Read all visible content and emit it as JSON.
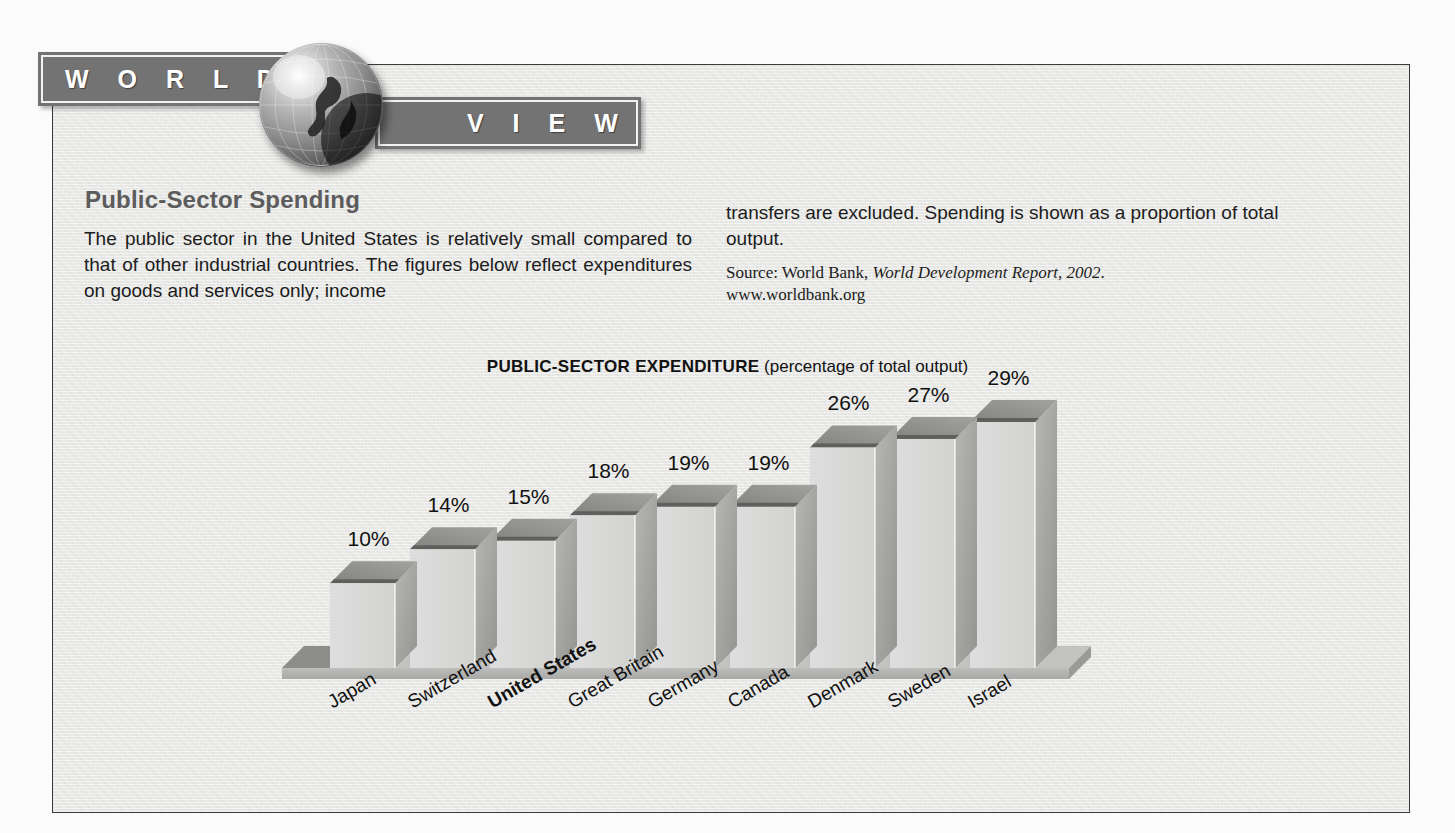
{
  "banner": {
    "word_left": "W O R L D",
    "word_right": "V I E W",
    "globe_icon": "globe-icon"
  },
  "article": {
    "headline": "Public-Sector Spending",
    "body_left": "The public sector in the United States is relatively small compared to that of other industrial countries. The figures below reflect expenditures on goods and services only; income",
    "body_right": "transfers are excluded. Spending is shown as a proportion of total output.",
    "source_prefix": "Source: World Bank, ",
    "source_italic": "World Development Report, 2002",
    "source_suffix": ".",
    "source_url": "www.worldbank.org"
  },
  "chart_data": {
    "type": "bar",
    "title": "PUBLIC-SECTOR EXPENDITURE",
    "subtitle": "(percentage of total output)",
    "xlabel": "",
    "ylabel": "",
    "ylim": [
      0,
      29
    ],
    "grid": false,
    "legend": "none",
    "value_suffix": "%",
    "emphasis_category": "United States",
    "categories": [
      "Japan",
      "Switzerland",
      "United States",
      "Great Britain",
      "Germany",
      "Canada",
      "Denmark",
      "Sweden",
      "Israel"
    ],
    "values": [
      10,
      14,
      15,
      18,
      19,
      19,
      26,
      27,
      29
    ],
    "value_labels": [
      "10%",
      "14%",
      "15%",
      "18%",
      "19%",
      "19%",
      "26%",
      "27%",
      "29%"
    ],
    "colors": {
      "bar_front": "#d9d9d7",
      "bar_top": "#8e8e8c",
      "bar_side": "#a3a3a1",
      "baseline": "#b5b5b3",
      "background": "#e9e9e7",
      "text": "#111111"
    }
  }
}
